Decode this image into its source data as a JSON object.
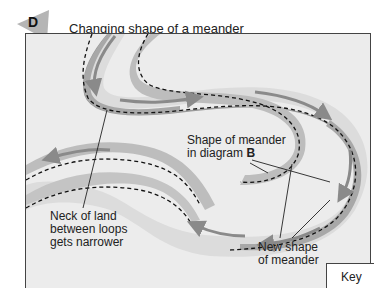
{
  "figure": {
    "badge_letter": "D",
    "title": "Changing shape of a meander",
    "colors": {
      "badge": "#b5b5b5",
      "background": "#ececec",
      "channel": "#dcdcdc",
      "old_bank": "#bdbdbd",
      "new_bank": "#a8a8a8",
      "arrow": "#8a8a8a",
      "dashed": "#111111"
    }
  },
  "labels": {
    "neck": [
      "Neck of land",
      "between loops",
      "gets narrower"
    ],
    "old_shape_line1": "Shape of meander",
    "old_shape_line2_prefix": "in diagram ",
    "old_shape_line2_bold": "B",
    "new_shape": [
      "New shape",
      "of meander"
    ]
  },
  "key": {
    "label": "Key"
  }
}
